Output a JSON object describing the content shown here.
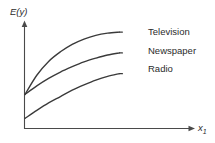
{
  "chart_data": {
    "type": "line",
    "title": "",
    "subtitle": "",
    "xlabel": "x1",
    "ylabel": "E(y)",
    "grid": false,
    "legend_position": "right-inline-at-curve-end",
    "axis_style": "arrow-axes-no-ticks",
    "xlim": [
      0,
      10
    ],
    "ylim": [
      0,
      10
    ],
    "x": [
      0,
      1,
      2,
      3,
      4,
      5,
      6,
      7,
      8
    ],
    "series": [
      {
        "name": "Television",
        "label": "Television",
        "color": "#3a3a3a",
        "values": [
          3.2,
          5.0,
          6.3,
          7.2,
          7.9,
          8.4,
          8.75,
          8.95,
          9.05
        ]
      },
      {
        "name": "Newspaper",
        "label": "Newspaper",
        "color": "#3a3a3a",
        "values": [
          3.2,
          4.0,
          4.7,
          5.3,
          5.8,
          6.25,
          6.6,
          6.9,
          7.1
        ]
      },
      {
        "name": "Radio",
        "label": "Radio",
        "color": "#3a3a3a",
        "values": [
          0.95,
          1.7,
          2.4,
          3.0,
          3.6,
          4.1,
          4.55,
          4.9,
          5.15
        ]
      }
    ],
    "annotations": []
  },
  "figure": {
    "background_color": "#ffffff",
    "line_color": "#3a3a3a",
    "axis_color": "#4a4a4a",
    "text_color": "#2b2b2b",
    "ylabel_text": "E(y)",
    "xlabel_base": "x",
    "xlabel_subscript": "1"
  }
}
